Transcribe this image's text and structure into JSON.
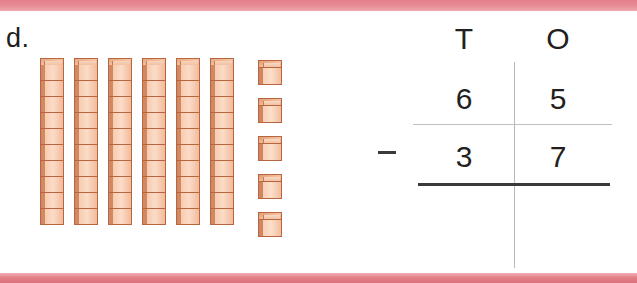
{
  "item": {
    "label": "d."
  },
  "colors": {
    "band": "#e8808a",
    "block_face": "#fbd9c3",
    "block_edge": "#b9653f",
    "ink": "#231f20",
    "rule_thin": "#bfbfbf",
    "rule_thick": "#3a3a3a"
  },
  "manipulatives": {
    "name": "base-ten-blocks",
    "tens_rods": 6,
    "cubes_per_rod": 10,
    "unit_cubes": 5,
    "represented_value": 65
  },
  "chart": {
    "headers": [
      "T",
      "O"
    ],
    "rows": [
      {
        "operator": "",
        "tens": "6",
        "ones": "5"
      },
      {
        "operator": "−",
        "tens": "3",
        "ones": "7"
      }
    ],
    "operator_symbol": "−"
  }
}
